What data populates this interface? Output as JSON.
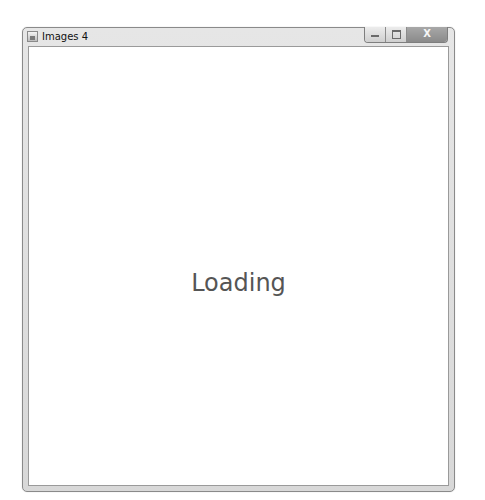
{
  "window": {
    "title": "Images 4",
    "controls": {
      "minimize": "minimize",
      "maximize": "maximize",
      "close": "X"
    }
  },
  "content": {
    "status_text": "Loading"
  }
}
